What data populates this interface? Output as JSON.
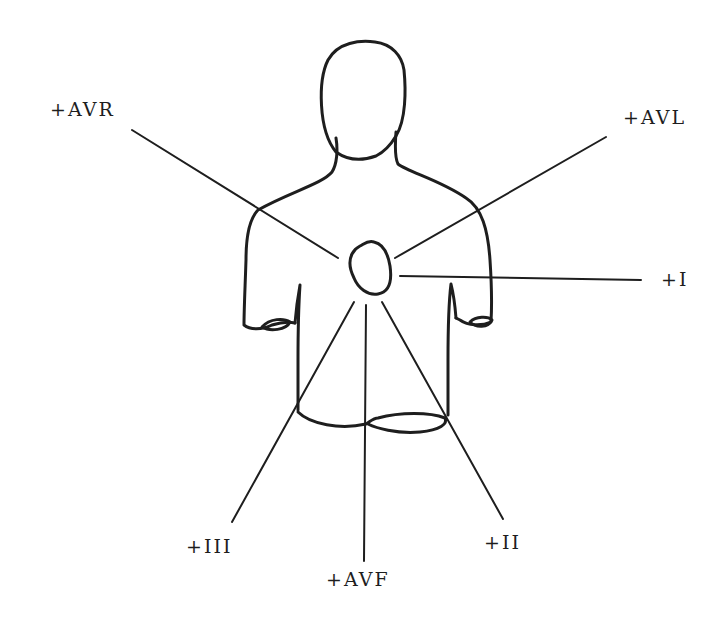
{
  "diagram": {
    "type": "hexaxial-lead-reference",
    "colors": {
      "ink": "#1e1e1e",
      "background": "#ffffff"
    },
    "leads": [
      {
        "id": "avr",
        "label": "+AVR",
        "label_pos": [
          50,
          100
        ],
        "line": [
          [
            132,
            130
          ],
          [
            338,
            258
          ]
        ]
      },
      {
        "id": "avl",
        "label": "+AVL",
        "label_pos": [
          623,
          108
        ],
        "line": [
          [
            606,
            137
          ],
          [
            395,
            258
          ]
        ]
      },
      {
        "id": "i",
        "label": "+I",
        "label_pos": [
          661,
          270
        ],
        "line": [
          [
            400,
            276
          ],
          [
            641,
            280
          ]
        ]
      },
      {
        "id": "ii",
        "label": "+II",
        "label_pos": [
          484,
          533
        ],
        "line": [
          [
            382,
            302
          ],
          [
            503,
            519
          ]
        ]
      },
      {
        "id": "avf",
        "label": "+AVF",
        "label_pos": [
          326,
          570
        ],
        "line": [
          [
            366,
            305
          ],
          [
            364,
            561
          ]
        ]
      },
      {
        "id": "iii",
        "label": "+III",
        "label_pos": [
          186,
          537
        ],
        "line": [
          [
            354,
            302
          ],
          [
            232,
            522
          ]
        ]
      }
    ]
  }
}
